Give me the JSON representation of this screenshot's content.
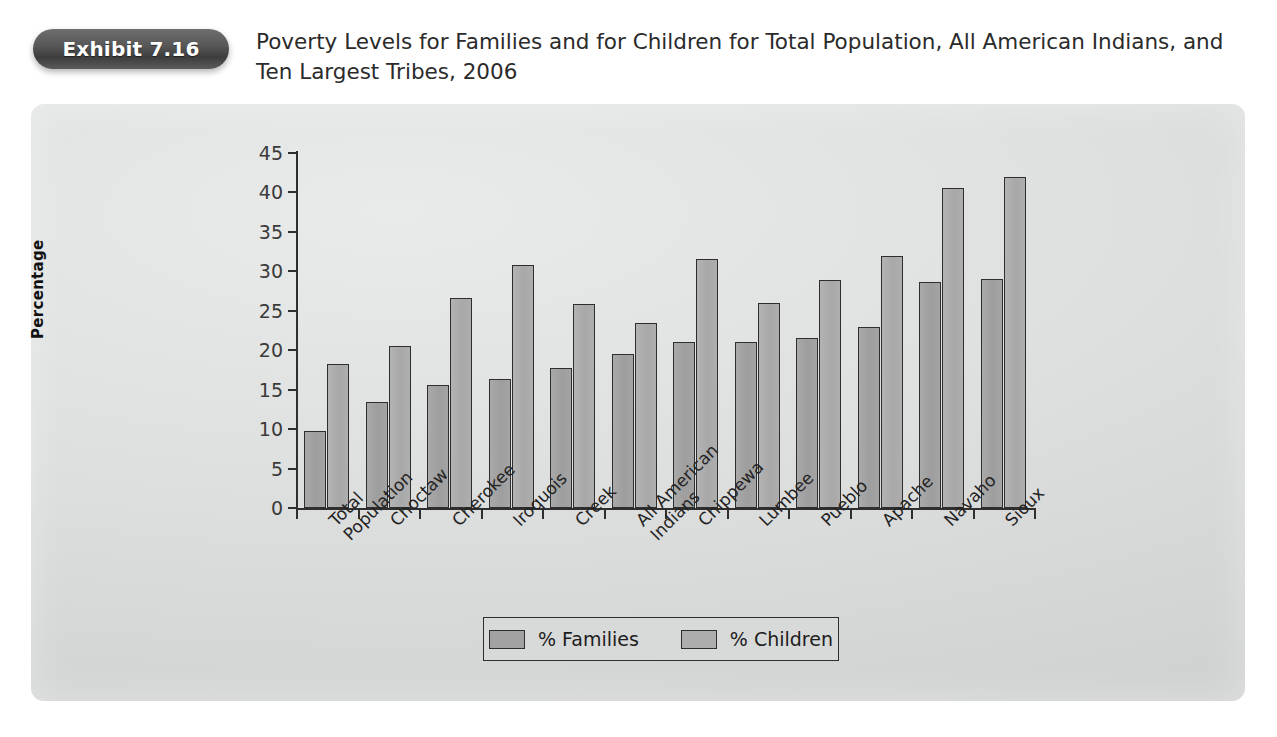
{
  "exhibit": {
    "badge_label": "Exhibit 7.16",
    "title": "Poverty Levels for Families and for Children for Total Population, All American Indians, and Ten Largest Tribes, 2006"
  },
  "legend": {
    "families_label": "% Families",
    "children_label": "% Children"
  },
  "colors": {
    "panel_background": "#dedfdf",
    "badge": "#4b4b4b",
    "families_bar": "#a2a2a2",
    "children_bar": "#adadad",
    "axis": "#2f2f2f",
    "text": "#232323"
  },
  "chart_data": {
    "type": "bar",
    "title": "Poverty Levels for Families and for Children for Total Population, All American Indians, and Ten Largest Tribes, 2006",
    "xlabel": "",
    "ylabel": "Percentage",
    "ylim": [
      0,
      45
    ],
    "ytick_step": 5,
    "yticks": [
      0,
      5,
      10,
      15,
      20,
      25,
      30,
      35,
      40,
      45
    ],
    "ytick_labels": [
      "0",
      "5",
      "10",
      "15",
      "20",
      "25",
      "30",
      "35",
      "40",
      "45"
    ],
    "grid": false,
    "legend_position": "bottom",
    "categories": [
      "Total Population",
      "Choctaw",
      "Cherokee",
      "Iroquois",
      "Creek",
      "All American Indians",
      "Chippewa",
      "Lumbee",
      "Pueblo",
      "Apache",
      "Navaho",
      "Sioux"
    ],
    "category_lines": [
      [
        "Total",
        "Population"
      ],
      [
        "Choctaw",
        ""
      ],
      [
        "Cherokee",
        ""
      ],
      [
        "Iroquois",
        ""
      ],
      [
        "Creek",
        ""
      ],
      [
        "All American",
        "Indians"
      ],
      [
        "Chippewa",
        ""
      ],
      [
        "Lumbee",
        ""
      ],
      [
        "Pueblo",
        ""
      ],
      [
        "Apache",
        ""
      ],
      [
        "Navaho",
        ""
      ],
      [
        "Sioux",
        ""
      ]
    ],
    "series": [
      {
        "name": "% Families",
        "values": [
          9.8,
          13.5,
          15.6,
          16.4,
          17.7,
          19.5,
          21.1,
          21.1,
          21.5,
          22.9,
          28.6,
          29.0
        ]
      },
      {
        "name": "% Children",
        "values": [
          18.3,
          20.5,
          26.6,
          30.8,
          25.9,
          23.5,
          31.6,
          26.0,
          28.9,
          31.9,
          40.6,
          41.9
        ]
      }
    ]
  }
}
